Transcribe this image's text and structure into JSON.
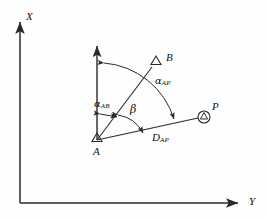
{
  "figure": {
    "kind": "surveying-azimuth-diagram",
    "background_color": "#fefefe",
    "line_color": "#2a2a2a"
  },
  "axes": {
    "x_label": "X",
    "y_label": "Y",
    "origin": {
      "x": 20,
      "y": 203
    },
    "x_axis_tip": {
      "x": 20,
      "y": 17
    },
    "y_axis_tip": {
      "x": 243,
      "y": 203
    }
  },
  "stations": [
    {
      "id": "A",
      "label": "A",
      "marker": "triangle",
      "x": 97,
      "y": 140,
      "label_x": 93,
      "label_y": 147
    },
    {
      "id": "B",
      "label": "B",
      "marker": "triangle",
      "x": 156,
      "y": 62,
      "label_x": 166,
      "label_y": 54
    },
    {
      "id": "P",
      "label": "P",
      "marker": "circled-triangle",
      "x": 204,
      "y": 117,
      "label_x": 213,
      "label_y": 104
    }
  ],
  "reference_direction": {
    "name": "north-arrow-at-A",
    "from": {
      "x": 97,
      "y": 140
    },
    "to": {
      "x": 97,
      "y": 42
    }
  },
  "annotations": {
    "alpha_ab": {
      "symbol": "α",
      "subscript": "AB",
      "x": 96,
      "y": 100
    },
    "alpha_ap": {
      "symbol": "α",
      "subscript": "AP",
      "x": 157,
      "y": 77
    },
    "beta": {
      "symbol": "β",
      "subscript": "",
      "x": 132,
      "y": 106
    },
    "d_ap": {
      "symbol": "D",
      "subscript": "AP",
      "x": 153,
      "y": 133
    }
  },
  "lines": [
    {
      "name": "line-A-to-B",
      "from": {
        "x": 97,
        "y": 140
      },
      "to": {
        "x": 153,
        "y": 66
      }
    },
    {
      "name": "line-A-to-P",
      "from": {
        "x": 97,
        "y": 140
      },
      "to": {
        "x": 199,
        "y": 118
      }
    }
  ],
  "arcs": [
    {
      "name": "arc-alpha-ap",
      "description": "large arc from vertical reference to line A-P"
    },
    {
      "name": "arc-alpha-ab",
      "description": "short double arrow from vertical reference to line A-B"
    },
    {
      "name": "arc-beta",
      "description": "double-headed arc between line A-B and line A-P"
    }
  ]
}
